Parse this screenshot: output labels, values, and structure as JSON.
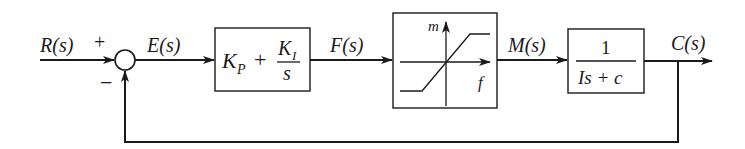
{
  "diagram": {
    "type": "feedback-control-block-diagram",
    "signals": {
      "input": "R(s)",
      "error": "E(s)",
      "controller_output": "F(s)",
      "actuator_output": "M(s)",
      "output": "C(s)"
    },
    "summing_junction": {
      "plus_sign": "+",
      "minus_sign": "−"
    },
    "blocks": {
      "controller": {
        "kp": "K",
        "kp_sub": "P",
        "plus": "+",
        "ki": "K",
        "ki_sub": "I",
        "den": "s"
      },
      "saturation": {
        "y_axis_label": "m",
        "x_axis_label": "f"
      },
      "plant": {
        "numerator": "1",
        "denominator": "Is + c"
      }
    },
    "colors": {
      "line": "#1a1a1a",
      "background": "#ffffff"
    }
  }
}
